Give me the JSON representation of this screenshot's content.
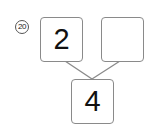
{
  "problem": {
    "number_label": "20",
    "top_left_value": "2",
    "top_right_value": "",
    "bottom_value": "4"
  },
  "colors": {
    "box_border": "#8a8a8a",
    "line": "#8a8a8a",
    "text": "#111111"
  }
}
